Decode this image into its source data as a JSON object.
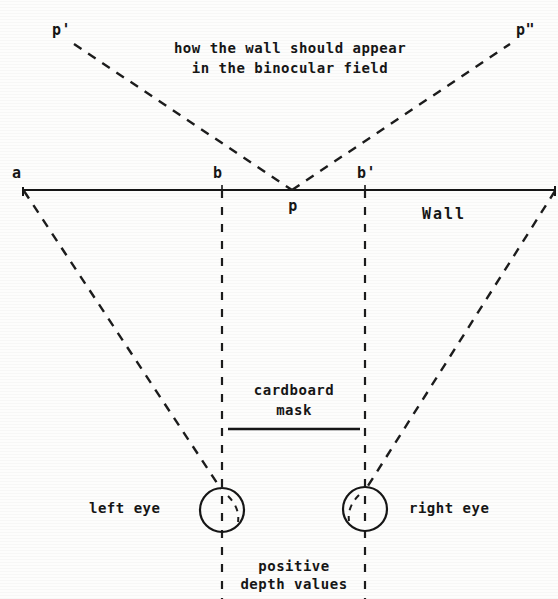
{
  "figure": {
    "title_note": "how the wall should appear in the binocular field",
    "caption_lines": [
      "how the wall should appear",
      "in the binocular field"
    ],
    "labels": {
      "p_prime": "p'",
      "p_double_prime": "p\"",
      "a": "a",
      "b": "b",
      "b_prime": "b'",
      "p": "p",
      "wall": "Wall",
      "cardboard": "cardboard",
      "mask": "mask",
      "left_eye": "left eye",
      "right_eye": "right eye",
      "positive": "positive",
      "depth_values": "depth values"
    },
    "colors": {
      "ink": "#161616",
      "paper": "#fdfdfc",
      "dashed": "#1c1c1c"
    },
    "geometry": {
      "wall_y": 190,
      "wall_x_start": 22,
      "wall_x_end": 556,
      "point_p_x": 292,
      "point_b_x": 222,
      "point_b_prime_x": 365,
      "left_eye": {
        "cx": 222,
        "cy": 510,
        "r": 22
      },
      "right_eye": {
        "cx": 365,
        "cy": 509,
        "r": 22
      },
      "mask_line": {
        "x1": 228,
        "x2": 360,
        "y": 429
      },
      "p_prime_point": {
        "x": 72,
        "y": 42
      },
      "p_double_prime_point": {
        "x": 512,
        "y": 42
      }
    }
  }
}
